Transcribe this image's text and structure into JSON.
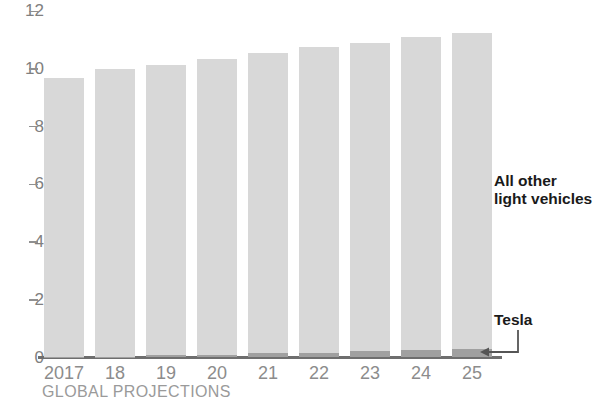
{
  "chart_data": {
    "type": "bar",
    "title": "",
    "subtitle": "",
    "xlabel": "GLOBAL PROJECTIONS",
    "ylabel": "",
    "ylim": [
      0,
      12
    ],
    "yticks": [
      0,
      2,
      4,
      6,
      8,
      10,
      12
    ],
    "grid": false,
    "legend_position": "right-inline",
    "stacked": true,
    "categories": [
      "2017",
      "18",
      "19",
      "20",
      "21",
      "22",
      "23",
      "24",
      "25"
    ],
    "series": [
      {
        "name": "Tesla",
        "color": "#a0a0a0",
        "values": [
          0.01,
          0.03,
          0.07,
          0.1,
          0.14,
          0.17,
          0.21,
          0.26,
          0.3
        ]
      },
      {
        "name": "All other light vehicles",
        "color": "#d8d8d8",
        "values": [
          9.69,
          9.97,
          10.08,
          10.25,
          10.41,
          10.58,
          10.69,
          10.84,
          10.95
        ]
      }
    ],
    "totals": [
      9.7,
      10.0,
      10.15,
      10.35,
      10.55,
      10.75,
      10.9,
      11.1,
      11.25
    ],
    "annotations": [
      {
        "text_line1": "All other",
        "text_line2": "light vehicles",
        "target": "All other light vehicles"
      },
      {
        "text_line1": "Tesla",
        "text_line2": "",
        "target": "Tesla"
      }
    ]
  },
  "axis": {
    "y_ticks": [
      {
        "label": "12",
        "value": 12
      },
      {
        "label": "10",
        "value": 10
      },
      {
        "label": "8",
        "value": 8
      },
      {
        "label": "6",
        "value": 6
      },
      {
        "label": "4",
        "value": 4
      },
      {
        "label": "2",
        "value": 2
      },
      {
        "label": "0",
        "value": 0
      }
    ],
    "x_labels": [
      "2017",
      "18",
      "19",
      "20",
      "21",
      "22",
      "23",
      "24",
      "25"
    ],
    "footer_note": "GLOBAL PROJECTIONS"
  },
  "labels": {
    "all_other_line1": "All other",
    "all_other_line2": "light vehicles",
    "tesla": "Tesla"
  },
  "colors": {
    "bar_other": "#d8d8d8",
    "bar_tesla": "#a0a0a0",
    "axis_line": "#6e6e6e",
    "tick_text": "#808080",
    "annotation_text": "#1a1a1a"
  }
}
